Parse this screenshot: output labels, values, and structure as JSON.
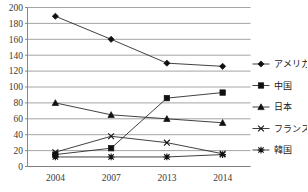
{
  "chart_data": {
    "type": "line",
    "title": "",
    "xlabel": "",
    "ylabel": "",
    "categories": [
      "2004",
      "2007",
      "2013",
      "2014"
    ],
    "ylim": [
      0,
      200
    ],
    "ytick_labels": [
      "0",
      "20",
      "40",
      "60",
      "80",
      "100",
      "120",
      "140",
      "160",
      "180",
      "200"
    ],
    "ytick_values": [
      0,
      20,
      40,
      60,
      80,
      100,
      120,
      140,
      160,
      180,
      200
    ],
    "grid": true,
    "legend_position": "right",
    "series": [
      {
        "name": "アメリカ",
        "marker": "diamond",
        "values": [
          189,
          160,
          130,
          126
        ]
      },
      {
        "name": "中国",
        "marker": "square",
        "values": [
          15,
          23,
          86,
          93
        ]
      },
      {
        "name": "日本",
        "marker": "triangle",
        "values": [
          80,
          65,
          60,
          55
        ]
      },
      {
        "name": "フランス",
        "marker": "x",
        "values": [
          18,
          38,
          30,
          16
        ]
      },
      {
        "name": "韓国",
        "marker": "star",
        "values": [
          12,
          12,
          12,
          15
        ]
      }
    ]
  },
  "legend": {
    "items": [
      {
        "label": "アメリカ",
        "marker": "diamond"
      },
      {
        "label": "中国",
        "marker": "square"
      },
      {
        "label": "日本",
        "marker": "triangle"
      },
      {
        "label": "フランス",
        "marker": "x"
      },
      {
        "label": "韓国",
        "marker": "star"
      }
    ]
  },
  "colors": {
    "line": "#2b2b2b",
    "marker": "#111111",
    "grid": "#8d8d8d",
    "axis": "#7a7a7a",
    "text": "#3a3a3a",
    "background": "#ffffff"
  }
}
